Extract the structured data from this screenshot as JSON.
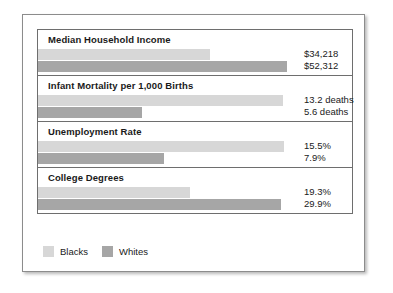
{
  "chart_data": {
    "type": "bar",
    "title": "",
    "orientation": "horizontal",
    "grid": false,
    "legend_position": "bottom-left",
    "categories": [
      "Median Household Income",
      "Infant Mortality per 1,000 Births",
      "Unemployment Rate",
      "College Degrees"
    ],
    "series": [
      {
        "name": "Blacks",
        "color": "#d7d7d7",
        "values": [
          34218,
          13.2,
          15.5,
          19.3
        ],
        "labels": [
          "$34,218",
          "13.2 deaths",
          "15.5%",
          "19.3%"
        ]
      },
      {
        "name": "Whites",
        "color": "#a6a6a6",
        "values": [
          52312,
          5.6,
          7.9,
          29.9
        ],
        "labels": [
          "$52,312",
          "5.6 deaths",
          "7.9%",
          "29.9%"
        ]
      }
    ],
    "groups": [
      {
        "title": "Median Household Income",
        "bars": [
          {
            "series": "Blacks",
            "label": "$34,218",
            "value": 34218,
            "width_px": 172
          },
          {
            "series": "Whites",
            "label": "$52,312",
            "value": 52312,
            "width_px": 249
          }
        ]
      },
      {
        "title": "Infant Mortality per 1,000 Births",
        "bars": [
          {
            "series": "Blacks",
            "label": "13.2 deaths",
            "value": 13.2,
            "width_px": 245
          },
          {
            "series": "Whites",
            "label": "5.6 deaths",
            "value": 5.6,
            "width_px": 104
          }
        ]
      },
      {
        "title": "Unemployment Rate",
        "bars": [
          {
            "series": "Blacks",
            "label": "15.5%",
            "value": 15.5,
            "width_px": 246
          },
          {
            "series": "Whites",
            "label": "7.9%",
            "value": 7.9,
            "width_px": 126
          }
        ]
      },
      {
        "title": "College Degrees",
        "bars": [
          {
            "series": "Blacks",
            "label": "19.3%",
            "value": 19.3,
            "width_px": 152
          },
          {
            "series": "Whites",
            "label": "29.9%",
            "value": 29.9,
            "width_px": 243
          }
        ]
      }
    ]
  },
  "legend": {
    "items": [
      {
        "label": "Blacks",
        "color": "#d7d7d7"
      },
      {
        "label": "Whites",
        "color": "#a6a6a6"
      }
    ]
  }
}
